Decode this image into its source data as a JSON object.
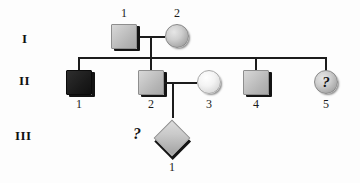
{
  "figure": {
    "type": "pedigree-chart",
    "generations": [
      {
        "id": "I",
        "label": "I"
      },
      {
        "id": "II",
        "label": "II"
      },
      {
        "id": "III",
        "label": "III"
      }
    ],
    "individuals": [
      {
        "key": "I-1",
        "generation": "I",
        "number": "1",
        "sex": "male",
        "shape": "square",
        "status": "carrier-shaded",
        "fill": "#c6c6c6",
        "marker": ""
      },
      {
        "key": "I-2",
        "generation": "I",
        "number": "2",
        "sex": "female",
        "shape": "circle",
        "status": "carrier-shaded",
        "fill": "#cfcfcf",
        "marker": ""
      },
      {
        "key": "II-1",
        "generation": "II",
        "number": "1",
        "sex": "male",
        "shape": "square",
        "status": "affected",
        "fill": "#1b1b1b",
        "marker": ""
      },
      {
        "key": "II-2",
        "generation": "II",
        "number": "2",
        "sex": "male",
        "shape": "square",
        "status": "carrier-shaded",
        "fill": "#c6c6c6",
        "marker": ""
      },
      {
        "key": "II-3",
        "generation": "II",
        "number": "3",
        "sex": "female",
        "shape": "circle",
        "status": "unaffected",
        "fill": "#f3f3f3",
        "marker": ""
      },
      {
        "key": "II-4",
        "generation": "II",
        "number": "4",
        "sex": "male",
        "shape": "square",
        "status": "carrier-shaded",
        "fill": "#c6c6c6",
        "marker": ""
      },
      {
        "key": "II-5",
        "generation": "II",
        "number": "5",
        "sex": "female",
        "shape": "circle",
        "status": "unknown",
        "fill": "#cfcfcf",
        "marker": "?"
      },
      {
        "key": "III-1",
        "generation": "III",
        "number": "1",
        "sex": "unknown",
        "shape": "diamond",
        "status": "unknown",
        "fill": "#c9c9c9",
        "marker": ""
      }
    ],
    "annotations": [
      {
        "key": "q-III-1",
        "text": "?",
        "refers_to": "III-1"
      }
    ],
    "colors": {
      "line": "#1c1c1c",
      "shaded": "#c6c6c6",
      "affected": "#1b1b1b",
      "unaffected": "#f3f3f3",
      "background": "#fdfdfd"
    }
  }
}
